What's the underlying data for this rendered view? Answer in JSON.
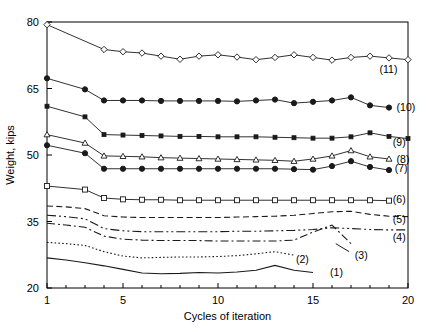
{
  "chart_data": {
    "type": "line",
    "title": "",
    "xlabel": "Cycles of iteration",
    "ylabel": "Weight, kips",
    "xlim": [
      1,
      20
    ],
    "ylim": [
      20,
      80
    ],
    "xticks": [
      1,
      5,
      10,
      15,
      20
    ],
    "xtick_labels": [
      "1",
      "5",
      "10",
      "15",
      "20"
    ],
    "yticks": [
      20,
      35,
      50,
      65,
      80
    ],
    "ytick_labels": [
      "20",
      "35",
      "50",
      "65",
      "80"
    ],
    "grid": false,
    "legend": "inline-right-labels",
    "minor_xticks": [
      2,
      3,
      4,
      6,
      7,
      8,
      9,
      11,
      12,
      13,
      14,
      16,
      17,
      18,
      19
    ],
    "series": [
      {
        "name": "(1)",
        "label": "(1)",
        "marker": "none",
        "linestyle": "solid",
        "label_x": 15.9,
        "label_y": 22.6,
        "x": [
          1,
          2,
          3,
          4,
          5,
          6,
          7,
          8,
          9,
          10,
          11,
          12,
          13,
          14,
          15
        ],
        "y": [
          26.8,
          26.3,
          25.7,
          25.0,
          24.2,
          23.4,
          23.2,
          23.3,
          23.5,
          23.4,
          23.6,
          24.0,
          25.1,
          24.0,
          23.5
        ]
      },
      {
        "name": "(2)",
        "label": "(2)",
        "marker": "none",
        "linestyle": "dotted",
        "label_x": 14.1,
        "label_y": 25.6,
        "x": [
          1,
          2,
          3,
          4,
          5,
          6,
          7,
          8,
          9,
          10,
          11,
          12,
          13,
          14
        ],
        "y": [
          30.3,
          30.0,
          29.6,
          28.2,
          27.2,
          26.8,
          26.9,
          27.0,
          27.0,
          27.1,
          27.3,
          27.7,
          28.2,
          27.4
        ]
      },
      {
        "name": "(3)",
        "label": "(3)",
        "marker": "none",
        "linestyle": "dashdot",
        "label_x": 17.2,
        "label_y": 26.6,
        "leader": {
          "x1": 16.9,
          "y1": 28.2,
          "x2": 16.2,
          "y2": 30.0
        },
        "x": [
          1,
          2,
          3,
          4,
          5,
          6,
          7,
          8,
          9,
          10,
          11,
          12,
          13,
          14,
          15,
          16,
          17
        ],
        "y": [
          34.6,
          34.2,
          33.7,
          31.7,
          31.0,
          30.8,
          30.7,
          30.7,
          30.7,
          30.6,
          30.6,
          30.6,
          30.6,
          30.8,
          32.6,
          34.2,
          30.0
        ]
      },
      {
        "name": "(4)",
        "label": "(4)",
        "marker": "none",
        "linestyle": "dashdotdot",
        "label_x": 19.2,
        "label_y": 30.6,
        "x": [
          1,
          2,
          3,
          4,
          5,
          6,
          7,
          8,
          9,
          10,
          11,
          12,
          13,
          14,
          15,
          16,
          17,
          18,
          19,
          20
        ],
        "y": [
          36.4,
          36.1,
          35.6,
          33.4,
          32.9,
          32.7,
          32.7,
          32.7,
          32.7,
          32.7,
          32.8,
          32.8,
          32.9,
          33.0,
          33.2,
          33.6,
          33.4,
          33.2,
          33.1,
          33.1
        ]
      },
      {
        "name": "(5)",
        "label": "(5)",
        "marker": "none",
        "linestyle": "dashed",
        "label_x": 19.2,
        "label_y": 34.6,
        "x": [
          1,
          2,
          3,
          4,
          5,
          6,
          7,
          8,
          9,
          10,
          11,
          12,
          13,
          14,
          15,
          16,
          17,
          18,
          19,
          20
        ],
        "y": [
          38.5,
          38.3,
          37.9,
          36.3,
          36.0,
          35.9,
          35.9,
          35.9,
          35.9,
          35.9,
          36.0,
          36.1,
          36.2,
          36.4,
          36.8,
          37.2,
          37.3,
          36.6,
          36.2,
          36.1
        ]
      },
      {
        "name": "(6)",
        "label": "(6)",
        "marker": "open-square",
        "linestyle": "solid",
        "label_x": 19.2,
        "label_y": 39.1,
        "x": [
          1,
          3,
          4,
          5,
          6,
          7,
          8,
          9,
          10,
          11,
          12,
          13,
          14,
          15,
          16,
          17,
          18,
          19
        ],
        "y": [
          43.0,
          42.2,
          40.3,
          40.0,
          39.9,
          39.9,
          39.8,
          39.8,
          39.8,
          39.8,
          39.8,
          39.8,
          39.8,
          39.8,
          39.8,
          39.8,
          39.8,
          39.7
        ]
      },
      {
        "name": "(7)",
        "label": "(7)",
        "marker": "filled-circle",
        "linestyle": "solid",
        "label_x": 19.3,
        "label_y": 46.2,
        "x": [
          1,
          3,
          4,
          5,
          6,
          7,
          8,
          9,
          10,
          11,
          12,
          13,
          14,
          15,
          16,
          17,
          18,
          19
        ],
        "y": [
          52.2,
          50.4,
          46.9,
          46.9,
          46.9,
          46.9,
          46.9,
          46.9,
          46.9,
          46.9,
          46.9,
          46.9,
          46.8,
          46.7,
          47.5,
          48.6,
          47.3,
          46.6
        ]
      },
      {
        "name": "(8)",
        "label": "(8)",
        "marker": "open-triangle",
        "linestyle": "solid",
        "label_x": 19.4,
        "label_y": 48.2,
        "x": [
          1,
          3,
          4,
          5,
          6,
          7,
          8,
          9,
          10,
          11,
          12,
          13,
          14,
          15,
          16,
          17,
          18,
          19
        ],
        "y": [
          54.6,
          52.7,
          49.8,
          49.7,
          49.6,
          49.4,
          49.3,
          49.2,
          49.1,
          49.0,
          48.9,
          48.8,
          48.6,
          49.1,
          49.8,
          51.0,
          49.6,
          49.1
        ]
      },
      {
        "name": "(9)",
        "label": "(9)",
        "marker": "small-square",
        "linestyle": "solid",
        "label_x": 19.2,
        "label_y": 52.0,
        "x": [
          1,
          3,
          4,
          5,
          6,
          7,
          8,
          9,
          10,
          11,
          12,
          13,
          14,
          15,
          16,
          17,
          18,
          19,
          20
        ],
        "y": [
          61.0,
          58.6,
          54.6,
          54.5,
          54.4,
          54.3,
          54.2,
          54.2,
          54.1,
          54.1,
          54.1,
          54.0,
          53.9,
          53.8,
          53.8,
          54.1,
          55.0,
          54.2,
          53.7
        ]
      },
      {
        "name": "(10)",
        "label": "(10)",
        "marker": "filled-circle",
        "linestyle": "solid",
        "label_x": 19.4,
        "label_y": 60.0,
        "x": [
          1,
          3,
          4,
          5,
          6,
          7,
          8,
          9,
          10,
          11,
          12,
          13,
          14,
          15,
          16,
          17,
          18,
          19
        ],
        "y": [
          67.3,
          64.8,
          62.3,
          62.3,
          62.3,
          62.2,
          62.2,
          62.2,
          62.2,
          62.1,
          62.3,
          62.5,
          61.7,
          62.0,
          62.3,
          63.0,
          61.2,
          60.7
        ]
      },
      {
        "name": "(11)",
        "label": "(11)",
        "marker": "open-diamond",
        "linestyle": "solid",
        "label_x": 18.5,
        "label_y": 68.4,
        "x": [
          1,
          4,
          5,
          6,
          7,
          8,
          9,
          10,
          11,
          12,
          13,
          14,
          15,
          16,
          17,
          18,
          19,
          20
        ],
        "y": [
          79.4,
          73.8,
          73.3,
          73.0,
          72.3,
          71.6,
          72.3,
          72.6,
          72.1,
          71.5,
          72.0,
          72.6,
          72.0,
          71.4,
          72.0,
          72.3,
          71.9,
          71.5
        ]
      }
    ]
  },
  "colors": {
    "axis": "#000000",
    "line": "#1a1a1a",
    "marker_fill": "#1a1a1a",
    "marker_open": "#ffffff",
    "background": "#ffffff"
  }
}
